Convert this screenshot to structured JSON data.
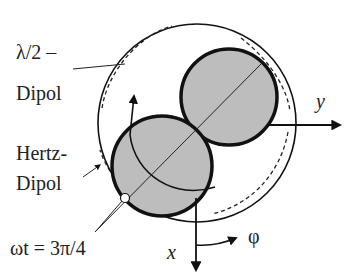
{
  "diagram": {
    "labels": {
      "halfwave_line1": "λ/2 –",
      "halfwave_line2": "Dipol",
      "hertz_line1": "Hertz-",
      "hertz_line2": "Dipol",
      "phase": "ωt = 3π/4",
      "axis_x": "x",
      "axis_y": "y",
      "axis_phi": "φ"
    },
    "colors": {
      "stroke": "#111111",
      "lobe_fill": "#bdbdbd",
      "background": "#ffffff"
    }
  }
}
